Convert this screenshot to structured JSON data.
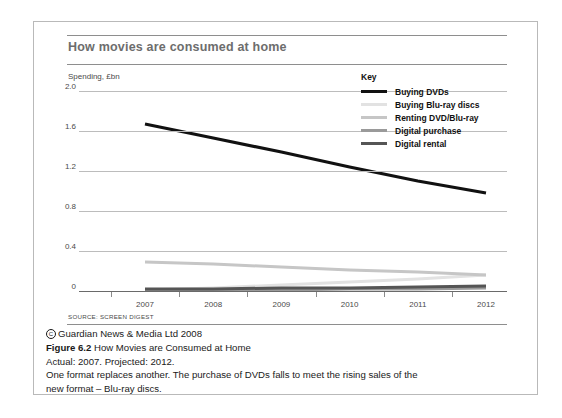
{
  "chart": {
    "title": "How movies are consumed at home",
    "y_axis_title": "Spending, £bn",
    "source": "SOURCE: SCREEN DIGEST",
    "legend_title": "Key"
  },
  "caption": {
    "copyright": "Guardian News & Media Ltd 2008",
    "figure_label": "Figure 6.2",
    "figure_title": "How Movies are Consumed at Home",
    "note": "Actual: 2007. Projected: 2012.",
    "body_line1": "One format replaces another. The purchase of DVDs falls to meet the rising sales of the",
    "body_line2": "new format – Blu-ray discs."
  },
  "chart_data": {
    "type": "line",
    "title": "How movies are consumed at home",
    "xlabel": "",
    "ylabel": "Spending, £bn",
    "categories": [
      "2007",
      "2008",
      "2009",
      "2010",
      "2011",
      "2012"
    ],
    "x": [
      2007,
      2008,
      2009,
      2010,
      2011,
      2012
    ],
    "ylim": [
      0,
      2.0
    ],
    "yticks": [
      "0",
      "0.4",
      "0.8",
      "1.2",
      "1.6",
      "2.0"
    ],
    "ytick_values": [
      0,
      0.4,
      0.8,
      1.2,
      1.6,
      2.0
    ],
    "grid": true,
    "legend_position": "top-right",
    "series": [
      {
        "name": "Buying DVDs",
        "color": "#111111",
        "width": 3.2,
        "values": [
          1.67,
          1.53,
          1.39,
          1.24,
          1.1,
          0.98
        ]
      },
      {
        "name": "Buying Blu-ray discs",
        "color": "#e2e2e2",
        "width": 3.0,
        "values": [
          0.01,
          0.03,
          0.06,
          0.09,
          0.12,
          0.16
        ]
      },
      {
        "name": "Renting DVD/Blu-ray",
        "color": "#c6c6c6",
        "width": 3.0,
        "values": [
          0.29,
          0.27,
          0.24,
          0.21,
          0.19,
          0.16
        ]
      },
      {
        "name": "Digital purchase",
        "color": "#9a9a9a",
        "width": 3.0,
        "values": [
          0.01,
          0.01,
          0.01,
          0.02,
          0.02,
          0.03
        ]
      },
      {
        "name": "Digital rental",
        "color": "#555555",
        "width": 3.0,
        "values": [
          0.02,
          0.02,
          0.03,
          0.03,
          0.04,
          0.05
        ]
      }
    ]
  }
}
